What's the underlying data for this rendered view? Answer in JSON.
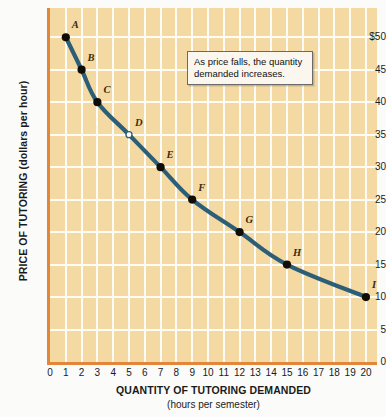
{
  "chart_data": {
    "type": "line",
    "title": "",
    "xlabel": "QUANTITY OF TUTORING DEMANDED",
    "xsublabel": "(hours per semester)",
    "ylabel": "PRICE OF TUTORING (dollars per hour)",
    "xlim": [
      0,
      20.7
    ],
    "ylim": [
      0,
      54.5
    ],
    "grid": true,
    "legend": "none",
    "x_tick_labels": [
      "0",
      "1",
      "2",
      "3",
      "4",
      "5",
      "6",
      "7",
      "8",
      "9",
      "10",
      "11",
      "12",
      "13",
      "14",
      "15",
      "16",
      "17",
      "18",
      "19",
      "20"
    ],
    "x_tick_values": [
      0,
      1,
      2,
      3,
      4,
      5,
      6,
      7,
      8,
      9,
      10,
      11,
      12,
      13,
      14,
      15,
      16,
      17,
      18,
      19,
      20
    ],
    "y_tick_labels": [
      "0",
      "5",
      "10",
      "15",
      "20",
      "25",
      "30",
      "35",
      "40",
      "45",
      "$50"
    ],
    "y_tick_values": [
      0,
      5,
      10,
      15,
      20,
      25,
      30,
      35,
      40,
      45,
      50
    ],
    "series": [
      {
        "name": "Demand for tutoring",
        "color": "#2c5f77",
        "points": [
          {
            "label": "A",
            "x": 1,
            "y": 50,
            "marker": "filled"
          },
          {
            "label": "B",
            "x": 2,
            "y": 45,
            "marker": "filled"
          },
          {
            "label": "C",
            "x": 3,
            "y": 40,
            "marker": "filled"
          },
          {
            "label": "D",
            "x": 5,
            "y": 35,
            "marker": "hollow"
          },
          {
            "label": "E",
            "x": 7,
            "y": 30,
            "marker": "filled"
          },
          {
            "label": "F",
            "x": 9,
            "y": 25,
            "marker": "filled"
          },
          {
            "label": "G",
            "x": 12,
            "y": 20,
            "marker": "filled"
          },
          {
            "label": "H",
            "x": 15,
            "y": 15,
            "marker": "filled"
          },
          {
            "label": "I",
            "x": 20,
            "y": 10,
            "marker": "filled"
          }
        ]
      }
    ],
    "annotations": [
      {
        "text": "As price falls, the quantity demanded increases."
      }
    ],
    "colors": {
      "plot_background": "#f4daa2",
      "gridline": "#fdfcf6",
      "axis": "#e2873a",
      "curve": "#2c5f77",
      "marker_fill": "#100c06",
      "marker_hollow_fill": "#ffffff",
      "label_text": "#3c2a10",
      "callout_background": "#fbf7ef",
      "callout_border": "#6a6a6a"
    }
  },
  "annotation": {
    "text": "As price falls, the quantity demanded increases."
  },
  "axes": {
    "x_title": "QUANTITY OF TUTORING DEMANDED",
    "x_subtitle": "(hours per semester)",
    "y_title": "PRICE OF TUTORING (dollars per hour)"
  }
}
